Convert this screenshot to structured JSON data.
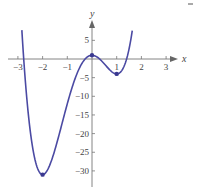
{
  "chart_data": {
    "type": "line",
    "title": "",
    "function": "f(x) = 3x^4 + 4x^3 - 12x^2 + 1",
    "xlabel": "x",
    "ylabel": "y",
    "xlim": [
      -3.3,
      3.6
    ],
    "ylim": [
      -33,
      9
    ],
    "x_ticks": [
      -3,
      -2,
      -1,
      1,
      2,
      3
    ],
    "x_tick_labels": [
      "−3",
      "−2",
      "−1",
      "1",
      "2",
      "3"
    ],
    "y_ticks": [
      5,
      -5,
      -10,
      -15,
      -20,
      -25,
      -30
    ],
    "y_tick_labels": [
      "5",
      "−5",
      "−10",
      "−15",
      "−20",
      "−25",
      "−30"
    ],
    "grid": false,
    "series": [
      {
        "name": "f(x)",
        "color": "#4b4aa3",
        "x": [
          -2.84,
          -2.7,
          -2.5,
          -2.3,
          -2.1,
          -2.0,
          -1.9,
          -1.7,
          -1.5,
          -1.3,
          -1.1,
          -0.9,
          -0.7,
          -0.5,
          -0.3,
          -0.1,
          0.0,
          0.2,
          0.4,
          0.6,
          0.8,
          1.0,
          1.2,
          1.4,
          1.5,
          1.63
        ],
        "y": [
          8.5,
          -0.3,
          -14.9,
          -24.1,
          -29.5,
          -31.0,
          -30.0,
          -24.8,
          -17.8,
          -10.4,
          -4.6,
          -1.9,
          -1.5,
          -1.8,
          -0.4,
          0.8,
          1.0,
          0.58,
          -0.59,
          -2.06,
          -3.3,
          -4.0,
          -3.5,
          -0.57,
          1.94,
          7.6
        ]
      }
    ],
    "critical_points": [
      {
        "x": -2,
        "y": -31,
        "label": "local minimum"
      },
      {
        "x": 0,
        "y": 1,
        "label": "local maximum"
      },
      {
        "x": 1,
        "y": -4,
        "label": "local minimum"
      }
    ],
    "legend": null
  }
}
